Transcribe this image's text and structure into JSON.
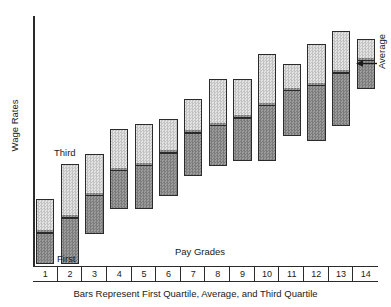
{
  "chart_data": {
    "type": "bar",
    "title": "",
    "subtitle": "",
    "caption": "Bars Represent First Quartile, Average, and Third Quartile",
    "xlabel": "Pay Grades",
    "ylabel": "Wage Rates",
    "grid": false,
    "legend_position": "none",
    "axis_note": "Wage Rates axis is unlabeled (no numeric ticks); values below are read as relative units where the x-axis baseline is 0 and the top of the plot area is 100.",
    "ylim": [
      0,
      100
    ],
    "categories": [
      "1",
      "2",
      "3",
      "4",
      "5",
      "6",
      "7",
      "8",
      "9",
      "10",
      "11",
      "12",
      "13",
      "14"
    ],
    "series": [
      {
        "name": "First Quartile",
        "values": [
          1,
          1,
          13,
          23,
          23,
          28,
          36,
          40,
          42,
          42,
          52,
          50,
          56,
          71
        ]
      },
      {
        "name": "Average",
        "values": [
          14,
          20,
          29,
          39,
          41,
          46,
          54,
          57,
          60,
          65,
          71,
          73,
          78,
          83
        ]
      },
      {
        "name": "Third Quartile",
        "values": [
          27,
          41,
          45,
          55,
          57,
          59,
          67,
          75,
          75,
          85,
          81,
          89,
          94,
          91
        ]
      }
    ],
    "annotations": [
      {
        "id": "third",
        "text": "Third",
        "target_category": "2",
        "target_series": "Third Quartile"
      },
      {
        "id": "first",
        "text": "First",
        "target_category": "2",
        "target_series": "First Quartile"
      },
      {
        "id": "average",
        "text": "Average",
        "target_category": "14",
        "target_series": "Average",
        "arrow": "left"
      }
    ],
    "colors": {
      "upper_segment": "#d4d4d4",
      "lower_segment": "#8c8c8c",
      "bar_outline": "#2b2b2b",
      "axis": "#2b2b2b",
      "text": "#1a1a1a",
      "background": "#ffffff"
    }
  }
}
